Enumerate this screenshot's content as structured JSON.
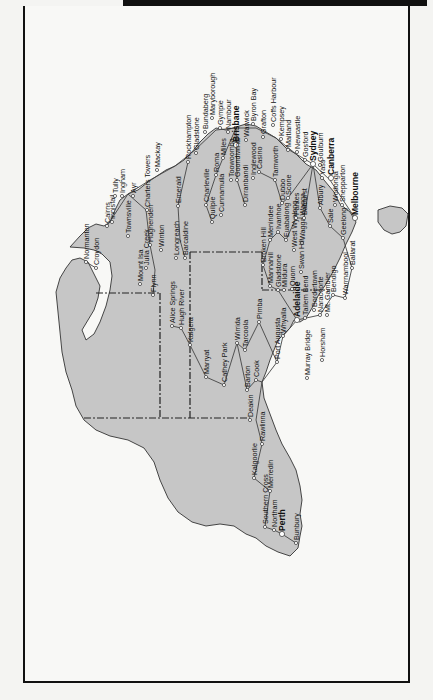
{
  "page": {
    "header_bar_text": "",
    "orientation_note": "map rotated 90° clockwise; north is to the left"
  },
  "map": {
    "title": "Australian railway network",
    "colors": {
      "land": "#c6c6c6",
      "coast": "#333333",
      "rail": "#444444",
      "border": "#222222",
      "sea": "#f8f8f6"
    },
    "cities": [
      {
        "name": "Cairns",
        "x": 107,
        "y": 226,
        "bold": false
      },
      {
        "name": "Innisfail",
        "x": 112,
        "y": 222,
        "bold": false
      },
      {
        "name": "Tully",
        "x": 115,
        "y": 196,
        "bold": false
      },
      {
        "name": "Ingham",
        "x": 122,
        "y": 196,
        "bold": false
      },
      {
        "name": "Townsville",
        "x": 128,
        "y": 236,
        "bold": false
      },
      {
        "name": "Ayr",
        "x": 133,
        "y": 196,
        "bold": false
      },
      {
        "name": "Charters Towers",
        "x": 147,
        "y": 210,
        "bold": false
      },
      {
        "name": "Mackay",
        "x": 157,
        "y": 170,
        "bold": false
      },
      {
        "name": "Hughenden",
        "x": 150,
        "y": 245,
        "bold": false
      },
      {
        "name": "Julia Creek",
        "x": 146,
        "y": 268,
        "bold": false
      },
      {
        "name": "Winton",
        "x": 161,
        "y": 250,
        "bold": false
      },
      {
        "name": "Longreach",
        "x": 176,
        "y": 258,
        "bold": false
      },
      {
        "name": "Barcaldine",
        "x": 185,
        "y": 258,
        "bold": false
      },
      {
        "name": "Emerald",
        "x": 178,
        "y": 206,
        "bold": false
      },
      {
        "name": "Rockhampton",
        "x": 188,
        "y": 162,
        "bold": false
      },
      {
        "name": "Gladstone",
        "x": 196,
        "y": 153,
        "bold": false
      },
      {
        "name": "Bundaberg",
        "x": 205,
        "y": 132,
        "bold": false
      },
      {
        "name": "Maryborough",
        "x": 212,
        "y": 118,
        "bold": false
      },
      {
        "name": "Gympie",
        "x": 220,
        "y": 128,
        "bold": false
      },
      {
        "name": "Nambour",
        "x": 228,
        "y": 132,
        "bold": false
      },
      {
        "name": "Brisbane",
        "x": 236,
        "y": 145,
        "bold": true
      },
      {
        "name": "Warwick",
        "x": 246,
        "y": 140,
        "bold": false
      },
      {
        "name": "Byron Bay",
        "x": 253,
        "y": 124,
        "bold": false
      },
      {
        "name": "Grafton",
        "x": 263,
        "y": 137,
        "bold": false
      },
      {
        "name": "Coffs Harbour",
        "x": 273,
        "y": 125,
        "bold": false
      },
      {
        "name": "Kempsey",
        "x": 281,
        "y": 139,
        "bold": false
      },
      {
        "name": "Maitland",
        "x": 288,
        "y": 150,
        "bold": false
      },
      {
        "name": "Newcastle",
        "x": 297,
        "y": 152,
        "bold": false
      },
      {
        "name": "Gosford",
        "x": 305,
        "y": 160,
        "bold": false
      },
      {
        "name": "Sydney",
        "x": 313,
        "y": 164,
        "bold": true
      },
      {
        "name": "Goulburn",
        "x": 320,
        "y": 165,
        "bold": false
      },
      {
        "name": "Yass",
        "x": 322,
        "y": 178,
        "bold": false
      },
      {
        "name": "Canberra",
        "x": 331,
        "y": 178,
        "bold": true
      },
      {
        "name": "Wodonga",
        "x": 335,
        "y": 205,
        "bold": false
      },
      {
        "name": "Shepparton",
        "x": 342,
        "y": 205,
        "bold": false
      },
      {
        "name": "Melbourne",
        "x": 355,
        "y": 218,
        "bold": true
      },
      {
        "name": "Sale",
        "x": 330,
        "y": 226,
        "bold": false
      },
      {
        "name": "Geelong",
        "x": 343,
        "y": 238,
        "bold": false
      },
      {
        "name": "Ballarat",
        "x": 352,
        "y": 268,
        "bold": false
      },
      {
        "name": "Warrnambool",
        "x": 345,
        "y": 298,
        "bold": false
      },
      {
        "name": "Bendigo",
        "x": 333,
        "y": 295,
        "bold": false
      },
      {
        "name": "Mt. Gambier",
        "x": 327,
        "y": 315,
        "bold": false
      },
      {
        "name": "Naracoorte",
        "x": 320,
        "y": 315,
        "bold": false
      },
      {
        "name": "Bordertown",
        "x": 314,
        "y": 310,
        "bold": false
      },
      {
        "name": "Tailem Bend",
        "x": 305,
        "y": 318,
        "bold": false
      },
      {
        "name": "Horsham",
        "x": 322,
        "y": 360,
        "bold": false
      },
      {
        "name": "Murray Bridge",
        "x": 307,
        "y": 378,
        "bold": false
      },
      {
        "name": "Adelaide",
        "x": 297,
        "y": 320,
        "bold": true
      },
      {
        "name": "Whyalla",
        "x": 283,
        "y": 336,
        "bold": false
      },
      {
        "name": "Port Augusta",
        "x": 277,
        "y": 362,
        "bold": false
      },
      {
        "name": "Quorn",
        "x": 292,
        "y": 289,
        "bold": false
      },
      {
        "name": "Mildura",
        "x": 284,
        "y": 290,
        "bold": false
      },
      {
        "name": "Gladstone",
        "x": 278,
        "y": 290,
        "bold": false
      },
      {
        "name": "Mannahill",
        "x": 270,
        "y": 286,
        "bold": false
      },
      {
        "name": "Broken Hill",
        "x": 263,
        "y": 265,
        "bold": false
      },
      {
        "name": "Menindee",
        "x": 270,
        "y": 240,
        "bold": false
      },
      {
        "name": "Ivanhoe",
        "x": 278,
        "y": 232,
        "bold": false
      },
      {
        "name": "Euabalong",
        "x": 286,
        "y": 240,
        "bold": false
      },
      {
        "name": "West Wyalong",
        "x": 294,
        "y": 250,
        "bold": false
      },
      {
        "name": "Wagga Wagga",
        "x": 302,
        "y": 243,
        "bold": false
      },
      {
        "name": "Swan Hill",
        "x": 301,
        "y": 272,
        "bold": false
      },
      {
        "name": "Albury",
        "x": 320,
        "y": 208,
        "bold": false
      },
      {
        "name": "Parkes",
        "x": 296,
        "y": 218,
        "bold": false
      },
      {
        "name": "Bathurst",
        "x": 304,
        "y": 218,
        "bold": false
      },
      {
        "name": "Dubbo",
        "x": 282,
        "y": 203,
        "bold": false
      },
      {
        "name": "Scone",
        "x": 288,
        "y": 198,
        "bold": false
      },
      {
        "name": "Tamworth",
        "x": 275,
        "y": 180,
        "bold": false
      },
      {
        "name": "Inglewood",
        "x": 253,
        "y": 178,
        "bold": false
      },
      {
        "name": "Casino",
        "x": 259,
        "y": 172,
        "bold": false
      },
      {
        "name": "Goondiwindi",
        "x": 237,
        "y": 180,
        "bold": false
      },
      {
        "name": "Toowoomba",
        "x": 231,
        "y": 180,
        "bold": false
      },
      {
        "name": "Dirranbandi",
        "x": 245,
        "y": 205,
        "bold": false
      },
      {
        "name": "Miles",
        "x": 223,
        "y": 158,
        "bold": false
      },
      {
        "name": "Roma",
        "x": 216,
        "y": 175,
        "bold": false
      },
      {
        "name": "Charleville",
        "x": 206,
        "y": 205,
        "bold": false
      },
      {
        "name": "Quilpie",
        "x": 212,
        "y": 222,
        "bold": false
      },
      {
        "name": "Cunnamulla",
        "x": 221,
        "y": 215,
        "bold": false
      },
      {
        "name": "Normanton",
        "x": 86,
        "y": 262,
        "bold": false
      },
      {
        "name": "Croydon",
        "x": 96,
        "y": 268,
        "bold": false
      },
      {
        "name": "Mount Isa",
        "x": 140,
        "y": 284,
        "bold": false
      },
      {
        "name": "Flynn",
        "x": 153,
        "y": 295,
        "bold": false
      },
      {
        "name": "Alice Springs",
        "x": 172,
        "y": 326,
        "bold": false
      },
      {
        "name": "Hugh River",
        "x": 181,
        "y": 328,
        "bold": false
      },
      {
        "name": "Kulgera",
        "x": 190,
        "y": 345,
        "bold": false
      },
      {
        "name": "Marryat",
        "x": 206,
        "y": 377,
        "bold": false
      },
      {
        "name": "Cathey Park",
        "x": 224,
        "y": 385,
        "bold": false
      },
      {
        "name": "Wirrida",
        "x": 237,
        "y": 343,
        "bold": false
      },
      {
        "name": "Tarcoola",
        "x": 245,
        "y": 350,
        "bold": false
      },
      {
        "name": "Pimba",
        "x": 259,
        "y": 322,
        "bold": false
      },
      {
        "name": "Barton",
        "x": 247,
        "y": 390,
        "bold": false
      },
      {
        "name": "Cook",
        "x": 256,
        "y": 380,
        "bold": false
      },
      {
        "name": "Deakin",
        "x": 250,
        "y": 420,
        "bold": false
      },
      {
        "name": "Rawlinna",
        "x": 262,
        "y": 444,
        "bold": false
      },
      {
        "name": "Kalgoorlie",
        "x": 254,
        "y": 478,
        "bold": false
      },
      {
        "name": "Merredin",
        "x": 270,
        "y": 491,
        "bold": false
      },
      {
        "name": "Southern Cross",
        "x": 265,
        "y": 527,
        "bold": false
      },
      {
        "name": "Northam",
        "x": 274,
        "y": 530,
        "bold": false
      },
      {
        "name": "Perth",
        "x": 282,
        "y": 534,
        "bold": true
      },
      {
        "name": "Bunbury",
        "x": 296,
        "y": 543,
        "bold": false
      }
    ]
  }
}
